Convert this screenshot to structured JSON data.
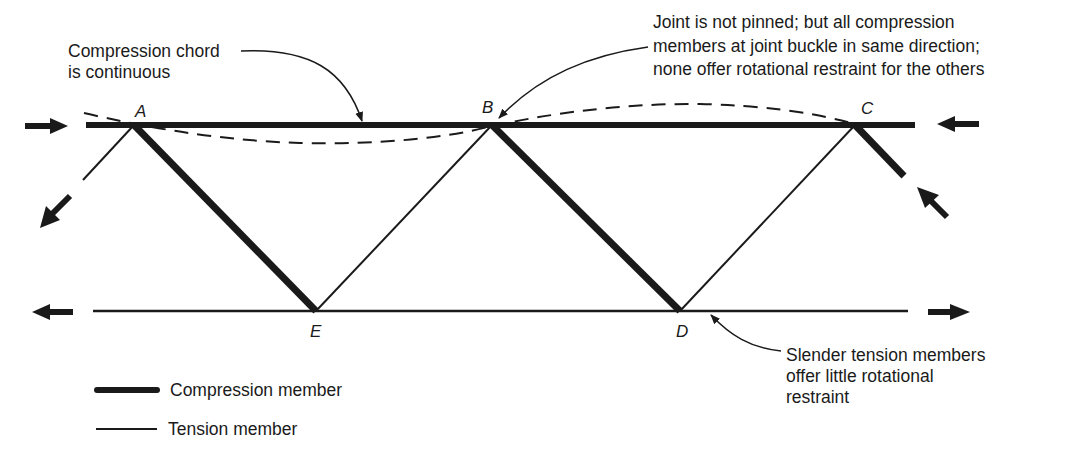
{
  "colors": {
    "ink": "#1a1a1a",
    "background": "#ffffff"
  },
  "joints": {
    "A": {
      "label": "A",
      "x": 134,
      "y": 125
    },
    "B": {
      "label": "B",
      "x": 492,
      "y": 125
    },
    "C": {
      "label": "C",
      "x": 855,
      "y": 125
    },
    "E": {
      "label": "E",
      "x": 316,
      "y": 311
    },
    "D": {
      "label": "D",
      "x": 680,
      "y": 311
    }
  },
  "annotations": {
    "compression_chord": {
      "lines": [
        "Compression chord",
        "is continuous"
      ]
    },
    "joint_not_pinned": {
      "lines": [
        "Joint is not pinned; but all compression",
        "members at joint buckle in same direction;",
        "none offer rotational restraint for the others"
      ]
    },
    "slender_tension": {
      "lines": [
        "Slender tension members",
        "offer little rotational",
        "restraint"
      ]
    }
  },
  "legend": {
    "items": [
      {
        "label": "Compression member",
        "style": "thick"
      },
      {
        "label": "Tension member",
        "style": "thin"
      }
    ]
  },
  "members": {
    "compression": [
      "A-C top chord",
      "A-E",
      "B-D",
      "C-stub"
    ],
    "tension": [
      "E-D bottom chord",
      "E-B",
      "D-C",
      "A-stub"
    ]
  }
}
